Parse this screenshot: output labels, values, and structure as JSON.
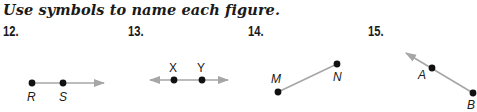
{
  "instruction": "Use symbols to name each figure.",
  "colors": {
    "line": "#a6a6a6",
    "point": "#111111",
    "text": "#1a1a1a"
  },
  "exercises": [
    {
      "number": "12.",
      "figure": "ray",
      "points": [
        "R",
        "S"
      ]
    },
    {
      "number": "13.",
      "figure": "line",
      "points": [
        "X",
        "Y"
      ]
    },
    {
      "number": "14.",
      "figure": "segment",
      "points": [
        "M",
        "N"
      ]
    },
    {
      "number": "15.",
      "figure": "ray",
      "points": [
        "B",
        "A"
      ]
    }
  ]
}
